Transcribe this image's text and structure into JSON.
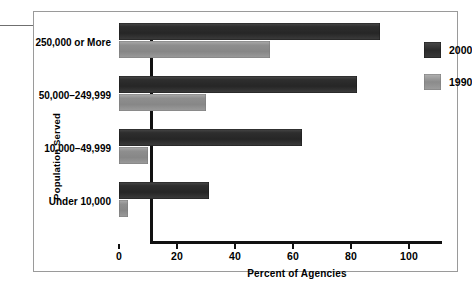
{
  "chart_data": {
    "type": "bar",
    "orientation": "horizontal",
    "title": "",
    "xlabel": "Percent of Agencies",
    "ylabel": "Population Served",
    "categories": [
      "250,000 or More",
      "50,000–249,999",
      "10,000–49,999",
      "Under 10,000"
    ],
    "series": [
      {
        "name": "2000",
        "color": "#2e2e2e",
        "values": [
          90,
          82,
          63,
          31
        ]
      },
      {
        "name": "1990",
        "color": "#8e8e8e",
        "values": [
          52,
          30,
          10,
          3
        ]
      }
    ],
    "xlim": [
      0,
      100
    ],
    "xticks": [
      "0",
      "20",
      "40",
      "60",
      "80",
      "100"
    ],
    "grid": false,
    "legend_position": "right"
  },
  "legend": {
    "items": [
      {
        "label": "2000",
        "swatch": "dark-gray-swatch"
      },
      {
        "label": "1990",
        "swatch": "light-gray-swatch"
      }
    ]
  }
}
